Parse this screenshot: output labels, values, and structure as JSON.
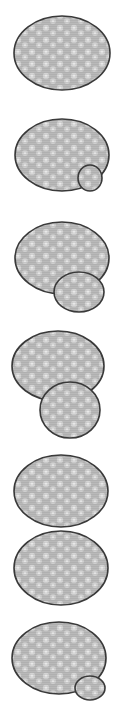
{
  "figure": {
    "width": 116,
    "height": 719,
    "background": "#ffffff",
    "fill_color": "#b8b8b8",
    "fill_highlight": "#e2e2e2",
    "stroke_color": "#3a3a3a",
    "stroke_width": 1.6
  },
  "cells": [
    {
      "id": "cell-1",
      "description": "single large cell",
      "shapes": [
        {
          "type": "ellipse",
          "role": "mother",
          "cx": 62,
          "cy": 53,
          "rx": 48,
          "ry": 37
        }
      ]
    },
    {
      "id": "cell-2",
      "description": "large cell with small bud",
      "shapes": [
        {
          "type": "ellipse",
          "role": "mother",
          "cx": 62,
          "cy": 155,
          "rx": 47,
          "ry": 36
        },
        {
          "type": "ellipse",
          "role": "bud",
          "cx": 90,
          "cy": 178,
          "rx": 12,
          "ry": 13
        }
      ]
    },
    {
      "id": "cell-3",
      "description": "large cell with medium bud",
      "shapes": [
        {
          "type": "ellipse",
          "role": "mother",
          "cx": 62,
          "cy": 258,
          "rx": 47,
          "ry": 36
        },
        {
          "type": "ellipse",
          "role": "bud",
          "cx": 79,
          "cy": 292,
          "rx": 25,
          "ry": 20
        }
      ]
    },
    {
      "id": "cell-4",
      "description": "large cell with large bud",
      "shapes": [
        {
          "type": "ellipse",
          "role": "mother",
          "cx": 58,
          "cy": 366,
          "rx": 46,
          "ry": 35
        },
        {
          "type": "ellipse",
          "role": "bud",
          "cx": 70,
          "cy": 410,
          "rx": 30,
          "ry": 28
        }
      ]
    },
    {
      "id": "cell-5",
      "description": "separated daughter cell (upper)",
      "shapes": [
        {
          "type": "ellipse",
          "role": "daughter",
          "cx": 61,
          "cy": 491,
          "rx": 47,
          "ry": 36
        }
      ]
    },
    {
      "id": "cell-6",
      "description": "separated daughter cell (lower)",
      "shapes": [
        {
          "type": "ellipse",
          "role": "daughter",
          "cx": 61,
          "cy": 568,
          "rx": 47,
          "ry": 37
        }
      ]
    },
    {
      "id": "cell-7",
      "description": "large cell with new small bud",
      "shapes": [
        {
          "type": "ellipse",
          "role": "mother",
          "cx": 59,
          "cy": 658,
          "rx": 47,
          "ry": 36
        },
        {
          "type": "ellipse",
          "role": "bud",
          "cx": 90,
          "cy": 688,
          "rx": 15,
          "ry": 12
        }
      ]
    }
  ]
}
